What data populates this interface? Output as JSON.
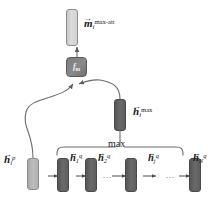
{
  "figure": {
    "type": "neural-network-architecture-diagram",
    "title_present": false,
    "background_color": "#ffffff",
    "colors": {
      "bar_light": "#d2d2d2",
      "bar_mid": "#b2b2b2",
      "bar_dark": "#5e5e5e",
      "function_box": "#828282",
      "wire": "#6b6b6b",
      "text": "#1a1a1a"
    }
  },
  "output": {
    "bar_name": "output-vector-bar",
    "label": {
      "symbol": "m",
      "vector_accent": "→",
      "subscript": "i",
      "superscript": "max-att",
      "plain_text": "m⃗ᵢ^{max-att}"
    }
  },
  "function_node": {
    "name": "merge-function-box",
    "label_symbol": "f",
    "label_subscript": "m",
    "plain_text": "f_m"
  },
  "max_pooled": {
    "bar_name": "h-max-bar",
    "label": {
      "symbol": "h",
      "vector_accent": "→",
      "subscript": "i",
      "superscript": "max",
      "plain_text": "h⃗ᵢ^{max}"
    }
  },
  "passage_state": {
    "bar_name": "h-passage-bar",
    "label": {
      "symbol": "h",
      "vector_accent": "→",
      "subscript": "i",
      "superscript": "p",
      "plain_text": "h⃗ᵢ^{p}"
    }
  },
  "pooling": {
    "operation_label": "max",
    "bracket_name": "max-pooling-bracket"
  },
  "sequence": {
    "name": "question-hidden-state-sequence",
    "ellipsis": "...",
    "states": [
      {
        "bar_name": "h-q-bar-1",
        "label": {
          "symbol": "h",
          "vector_accent": "→",
          "subscript": "1",
          "superscript": "q",
          "plain_text": "h⃗₁^{q}"
        }
      },
      {
        "bar_name": "h-q-bar-2",
        "label": {
          "symbol": "h",
          "vector_accent": "→",
          "subscript": "2",
          "superscript": "q",
          "plain_text": "h⃗₂^{q}"
        }
      },
      {
        "bar_name": "h-q-bar-j",
        "label": {
          "symbol": "h",
          "vector_accent": "→",
          "subscript": "j",
          "superscript": "q",
          "plain_text": "h⃗ⱼ^{q}"
        }
      },
      {
        "bar_name": "h-q-bar-N",
        "label": {
          "symbol": "h",
          "vector_accent": "→",
          "subscript": "N",
          "superscript": "q",
          "plain_text": "h⃗_N^{q}"
        }
      }
    ]
  }
}
